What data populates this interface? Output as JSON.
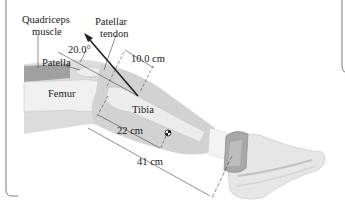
{
  "labels": {
    "quadriceps": "Quadriceps",
    "muscle": "muscle",
    "patellar": "Patellar",
    "tendon": "tendon",
    "angle": "20.0°",
    "patella": "Patella",
    "dist_tendon": "10.0 cm",
    "femur": "Femur",
    "tibia": "Tibia",
    "dist_cm": "22 cm",
    "dist_weight": "41 cm"
  },
  "colors": {
    "skin_light": "#e4e4e4",
    "skin_mid": "#cfcfcf",
    "bone": "#efefef",
    "muscle": "#8a8a8a",
    "weight": "#a9a9a9",
    "shoe": "#e8e8e8",
    "line": "#333333",
    "frame": "#7a7a7a"
  }
}
